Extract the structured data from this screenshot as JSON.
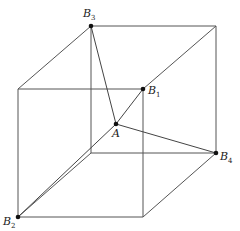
{
  "diagram": {
    "type": "cube-with-interior-point",
    "cube": {
      "front_face": {
        "tl": [
          18,
          89
        ],
        "tr": [
          143,
          89
        ],
        "br": [
          143,
          217
        ],
        "bl": [
          18,
          217
        ]
      },
      "back_face": {
        "tl": [
          91,
          26
        ],
        "tr": [
          216,
          26
        ],
        "br": [
          216,
          153
        ],
        "bl": [
          91,
          153
        ]
      }
    },
    "points": {
      "A": {
        "label": "A",
        "subscript": "",
        "pos": [
          116,
          124
        ]
      },
      "B1": {
        "label": "B",
        "subscript": "1",
        "pos": [
          143,
          89
        ]
      },
      "B2": {
        "label": "B",
        "subscript": "2",
        "pos": [
          18,
          217
        ]
      },
      "B3": {
        "label": "B",
        "subscript": "3",
        "pos": [
          91,
          26
        ]
      },
      "B4": {
        "label": "B",
        "subscript": "4",
        "pos": [
          216,
          153
        ]
      }
    },
    "segments": [
      [
        "A",
        "B1"
      ],
      [
        "A",
        "B2"
      ],
      [
        "A",
        "B3"
      ],
      [
        "A",
        "B4"
      ]
    ]
  }
}
